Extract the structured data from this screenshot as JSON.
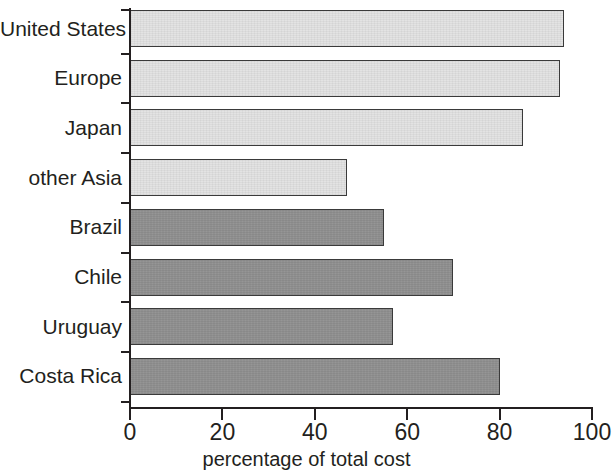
{
  "chart_data": {
    "type": "bar",
    "orientation": "horizontal",
    "title": "",
    "xlabel": "percentage of total cost",
    "ylabel": "",
    "xlim": [
      0,
      100
    ],
    "xticks": [
      0,
      20,
      40,
      60,
      80,
      100
    ],
    "xtick_labels": [
      "0",
      "20",
      "40",
      "60",
      "80",
      "100"
    ],
    "grid": false,
    "legend": false,
    "categories": [
      "United States",
      "Europe",
      "Japan",
      "other Asia",
      "Brazil",
      "Chile",
      "Uruguay",
      "Costa Rica"
    ],
    "values": [
      94,
      93,
      85,
      47,
      55,
      70,
      57,
      80
    ],
    "bar_groups": [
      "light",
      "light",
      "light",
      "light",
      "dark",
      "dark",
      "dark",
      "dark"
    ],
    "colors": {
      "light_fill": "#e3e3e3",
      "dark_fill": "#909090",
      "bar_outline": "#3a3a3a",
      "axis": "#231f20",
      "text": "#231f20",
      "background": "#ffffff"
    },
    "bars": [
      {
        "label": "United States",
        "value": 94,
        "group": "light"
      },
      {
        "label": "Europe",
        "value": 93,
        "group": "light"
      },
      {
        "label": "Japan",
        "value": 85,
        "group": "light"
      },
      {
        "label": "other Asia",
        "value": 47,
        "group": "light"
      },
      {
        "label": "Brazil",
        "value": 55,
        "group": "dark"
      },
      {
        "label": "Chile",
        "value": 70,
        "group": "dark"
      },
      {
        "label": "Uruguay",
        "value": 57,
        "group": "dark"
      },
      {
        "label": "Costa Rica",
        "value": 80,
        "group": "dark"
      }
    ]
  }
}
